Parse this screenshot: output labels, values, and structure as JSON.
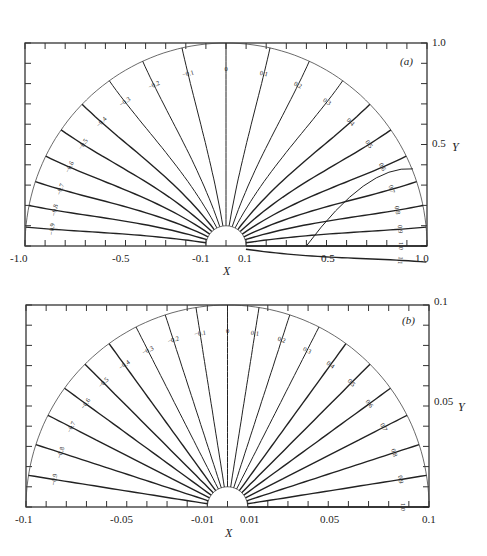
{
  "chart_data": [
    {
      "type": "contour",
      "panel_label": "(a)",
      "title": "",
      "xlabel": "X",
      "ylabel": "Y",
      "xlim": [
        -1.0,
        1.0
      ],
      "ylim": [
        0.0,
        1.0
      ],
      "x_tick_labels": [
        "-1.0",
        "-0.5",
        "-0.1",
        "0.1",
        "0.5",
        "1.0"
      ],
      "y_tick_labels": [
        "0.5",
        "1.0"
      ],
      "domain": "half-annulus between inner radius 0.1 and outer radius 1.0",
      "contour_levels": [
        "-0.9",
        "-0.8",
        "-0.7",
        "-0.6",
        "-0.5",
        "-0.4",
        "-0.3",
        "-0.2",
        "-0.1",
        "0",
        "0.1",
        "0.2",
        "0.3",
        "0.4",
        "0.5",
        "0.6",
        "0.7",
        "0.8",
        "0.9",
        "1.0",
        "1.1"
      ],
      "grid": false,
      "legend": "none"
    },
    {
      "type": "contour",
      "panel_label": "(b)",
      "title": "",
      "xlabel": "X",
      "ylabel": "Y",
      "xlim": [
        -0.1,
        0.1
      ],
      "ylim": [
        0.0,
        0.1
      ],
      "x_tick_labels": [
        "-0.1",
        "-0.05",
        "-0.01",
        "0.01",
        "0.05",
        "0.1"
      ],
      "y_tick_labels": [
        "0.05",
        "0.1"
      ],
      "domain": "half-annulus between inner radius 0.01 and outer radius 0.1",
      "contour_levels": [
        "-0.9",
        "-0.8",
        "-0.7",
        "-0.6",
        "-0.5",
        "-0.4",
        "-0.3",
        "-0.2",
        "-0.1",
        "0",
        "0.1",
        "0.2",
        "0.3",
        "0.4",
        "0.5",
        "0.6",
        "0.7",
        "0.8",
        "0.9",
        "1.0"
      ],
      "grid": false,
      "legend": "none"
    }
  ],
  "panels": {
    "a": {
      "label": "(a)",
      "xlabel": "X",
      "ylabel": "Y",
      "xticks": {
        "m1": "-1.0",
        "m05": "-0.5",
        "m01": "-0.1",
        "p01": "0.1",
        "p05": "0.5",
        "p1": "1.0"
      },
      "yticks": {
        "mid": "0.5",
        "top": "1.0"
      }
    },
    "b": {
      "label": "(b)",
      "xlabel": "X",
      "ylabel": "Y",
      "xticks": {
        "m1": "-0.1",
        "m05": "-0.05",
        "m01": "-0.01",
        "p01": "0.01",
        "p05": "0.05",
        "p1": "0.1"
      },
      "yticks": {
        "mid": "0.05",
        "top": "0.1"
      }
    }
  }
}
